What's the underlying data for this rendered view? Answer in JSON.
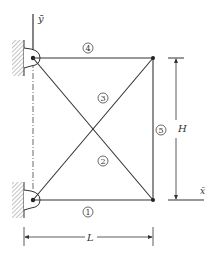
{
  "diagram": {
    "type": "truss",
    "axis_labels": {
      "y": "ȳ",
      "x": "x̄"
    },
    "dimensions": {
      "horizontal": "L",
      "vertical": "H"
    },
    "members": [
      {
        "id": "1",
        "label": "1",
        "from": "bottom-left",
        "to": "bottom-right"
      },
      {
        "id": "2",
        "label": "2",
        "from": "top-left",
        "to": "bottom-right"
      },
      {
        "id": "3",
        "label": "3",
        "from": "bottom-left",
        "to": "top-right"
      },
      {
        "id": "4",
        "label": "4",
        "from": "top-left",
        "to": "top-right"
      },
      {
        "id": "5",
        "label": "5",
        "from": "bottom-right",
        "to": "top-right"
      }
    ],
    "supports": [
      "top-left pin to wall",
      "bottom-left pin to wall"
    ],
    "colors": {
      "line": "#333333",
      "hatch": "#777777",
      "background": "#ffffff"
    }
  }
}
